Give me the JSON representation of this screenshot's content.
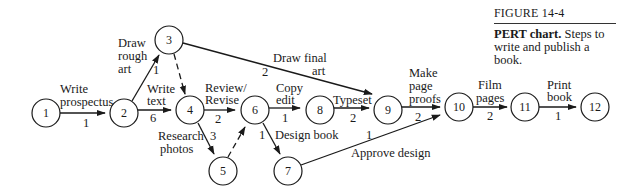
{
  "caption": {
    "figure_number": "FIGURE 14-4",
    "title": "PERT chart.",
    "description": " Steps to write and publish a book."
  },
  "nodes": [
    {
      "id": "1",
      "label": "1",
      "x": 46,
      "y": 113
    },
    {
      "id": "2",
      "label": "2",
      "x": 124,
      "y": 113
    },
    {
      "id": "3",
      "label": "3",
      "x": 169,
      "y": 40
    },
    {
      "id": "4",
      "label": "4",
      "x": 190,
      "y": 110
    },
    {
      "id": "5",
      "label": "5",
      "x": 223,
      "y": 171
    },
    {
      "id": "6",
      "label": "6",
      "x": 255,
      "y": 110
    },
    {
      "id": "7",
      "label": "7",
      "x": 288,
      "y": 171
    },
    {
      "id": "8",
      "label": "8",
      "x": 320,
      "y": 110
    },
    {
      "id": "9",
      "label": "9",
      "x": 388,
      "y": 110
    },
    {
      "id": "10",
      "label": "10",
      "x": 459,
      "y": 107
    },
    {
      "id": "11",
      "label": "11",
      "x": 525,
      "y": 107
    },
    {
      "id": "12",
      "label": "12",
      "x": 595,
      "y": 107
    }
  ],
  "edges": [
    {
      "from": "1",
      "to": "2",
      "task": "Write prospectus",
      "duration": "1",
      "dashed": false
    },
    {
      "from": "2",
      "to": "3",
      "task": "Draw rough art",
      "duration": "1",
      "dashed": false
    },
    {
      "from": "2",
      "to": "4",
      "task": "Write text",
      "duration": "6",
      "dashed": false
    },
    {
      "from": "3",
      "to": "4",
      "task": "",
      "duration": "",
      "dashed": true
    },
    {
      "from": "3",
      "to": "9",
      "task": "Draw final art",
      "duration": "2",
      "dashed": false
    },
    {
      "from": "4",
      "to": "6",
      "task": "Review/ Revise",
      "duration": "2",
      "dashed": false
    },
    {
      "from": "4",
      "to": "5",
      "task": "Research photos",
      "duration": "3",
      "dashed": false
    },
    {
      "from": "5",
      "to": "6",
      "task": "",
      "duration": "",
      "dashed": true
    },
    {
      "from": "6",
      "to": "8",
      "task": "Copy edit",
      "duration": "1",
      "dashed": false
    },
    {
      "from": "6",
      "to": "7",
      "task": "Design book",
      "duration": "1",
      "dashed": false
    },
    {
      "from": "8",
      "to": "9",
      "task": "Typeset",
      "duration": "2",
      "dashed": false
    },
    {
      "from": "9",
      "to": "10",
      "task": "Make page proofs",
      "duration": "2",
      "dashed": false
    },
    {
      "from": "7",
      "to": "10",
      "task": "Approve design",
      "duration": "1",
      "dashed": false
    },
    {
      "from": "10",
      "to": "11",
      "task": "Film pages",
      "duration": "2",
      "dashed": false
    },
    {
      "from": "11",
      "to": "12",
      "task": "Print book",
      "duration": "1",
      "dashed": false
    }
  ],
  "labels": {
    "e12_task_l1": "Write",
    "e12_task_l2": "prospectus",
    "e12_dur": "1",
    "e23_task_l1": "Draw",
    "e23_task_l2": "rough",
    "e23_task_l3": "art",
    "e23_dur": "1",
    "e24_task_l1": "Write",
    "e24_task_l2": "text",
    "e24_dur": "6",
    "e39_task_l1": "Draw final",
    "e39_task_l2": "art",
    "e39_dur": "2",
    "e46_task_l1": "Review/",
    "e46_task_l2": "Revise",
    "e46_dur": "2",
    "e45_task_l1": "Research",
    "e45_task_l2": "photos",
    "e45_dur": "3",
    "e68_task_l1": "Copy",
    "e68_task_l2": "edit",
    "e68_dur": "1",
    "e67_task": "Design book",
    "e67_dur": "1",
    "e89_task": "Typeset",
    "e89_dur": "2",
    "e910_task_l1": "Make",
    "e910_task_l2": "page",
    "e910_task_l3": "proofs",
    "e910_dur": "2",
    "e710_task": "Approve design",
    "e710_dur": "1",
    "e1011_task_l1": "Film",
    "e1011_task_l2": "pages",
    "e1011_dur": "2",
    "e1112_task_l1": "Print",
    "e1112_task_l2": "book",
    "e1112_dur": "1"
  },
  "colors": {
    "ink": "#1a1a1a",
    "background": "#ffffff"
  }
}
